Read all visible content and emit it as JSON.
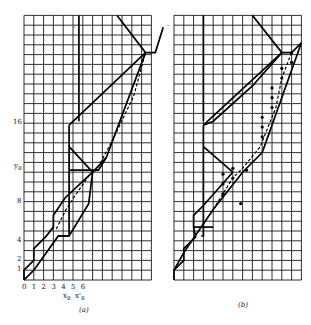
{
  "figure": {
    "cell_px": 9.8,
    "cols": 13,
    "rows": 27,
    "grid_color": "#1a1a1a",
    "line_color": "#000000"
  },
  "panels": [
    {
      "id": "a",
      "caption": "(a)",
      "origin_px": [
        24,
        280
      ],
      "x_ticks": [
        "0",
        "1",
        "2",
        "3",
        "4",
        "5",
        "6"
      ],
      "x_axis_label": "x_B  x'_B",
      "x_axis_label_parts": [
        "x",
        "B",
        "x'",
        "B"
      ],
      "y_ticks": [
        {
          "label": "1",
          "v": 1
        },
        {
          "label": "2",
          "v": 2
        },
        {
          "label": "4",
          "v": 4
        },
        {
          "label": "8",
          "v": 8
        },
        {
          "label": "16",
          "v": 16
        }
      ],
      "y_axis_label": "y_B",
      "y_axis_label_parts": [
        "y",
        "B"
      ],
      "y_axis_label_v": 11.6,
      "thick_lines": [
        [
          [
            5.6,
            27
          ],
          [
            5.6,
            16.2
          ]
        ],
        [
          [
            9.5,
            27
          ],
          [
            12.4,
            23.2
          ],
          [
            13.4,
            23.2
          ],
          [
            14.2,
            25.8
          ]
        ],
        [
          [
            4.6,
            15.8
          ],
          [
            4.6,
            4.5
          ],
          [
            3.5,
            4.5
          ]
        ],
        [
          [
            0,
            0
          ],
          [
            0,
            1
          ],
          [
            1,
            2
          ],
          [
            1,
            3.2
          ],
          [
            2.2,
            4.4
          ],
          [
            3,
            5.4
          ],
          [
            3,
            6.6
          ],
          [
            4.2,
            8.4
          ],
          [
            7,
            11
          ]
        ],
        [
          [
            4.6,
            15.8
          ],
          [
            12.4,
            23.2
          ]
        ],
        [
          [
            4.6,
            13.6
          ],
          [
            7,
            11
          ]
        ],
        [
          [
            0,
            0
          ],
          [
            1,
            1
          ],
          [
            3.5,
            4.5
          ],
          [
            4.6,
            4.5
          ],
          [
            6.6,
            7.8
          ],
          [
            7,
            11
          ],
          [
            8.4,
            12.5
          ],
          [
            12.4,
            23.2
          ]
        ],
        [
          [
            4.6,
            11.2
          ],
          [
            7.6,
            11.2
          ],
          [
            8.4,
            12.5
          ]
        ]
      ],
      "dashed_lines": [
        [
          [
            3.3,
            5.2
          ],
          [
            4.3,
            7.2
          ],
          [
            5.2,
            8.6
          ],
          [
            6.6,
            10.6
          ],
          [
            7.4,
            11.2
          ],
          [
            9.2,
            14.6
          ],
          [
            11.2,
            18.8
          ],
          [
            12.4,
            23.2
          ]
        ]
      ]
    },
    {
      "id": "b",
      "caption": "(b)",
      "origin_px": [
        174,
        280
      ],
      "x_ticks": [],
      "y_ticks": [],
      "thick_lines": [
        [
          [
            3,
            27
          ],
          [
            3,
            16.2
          ]
        ],
        [
          [
            8,
            27
          ],
          [
            11,
            23.2
          ],
          [
            12,
            23.2
          ],
          [
            13,
            24.2
          ]
        ],
        [
          [
            3,
            15.8
          ],
          [
            3,
            4.5
          ],
          [
            2.8,
            4.5
          ]
        ],
        [
          [
            0,
            0
          ],
          [
            0,
            1
          ],
          [
            1,
            2
          ],
          [
            1,
            3.2
          ],
          [
            2.2,
            4.4
          ],
          [
            2,
            5.4
          ],
          [
            2,
            6.6
          ],
          [
            3,
            7.6
          ],
          [
            6,
            11
          ]
        ],
        [
          [
            3,
            15.8
          ],
          [
            11,
            23.2
          ]
        ],
        [
          [
            3,
            13.6
          ],
          [
            6,
            11
          ]
        ],
        [
          [
            0,
            1
          ],
          [
            1,
            2.8
          ],
          [
            4,
            7.2
          ],
          [
            7,
            11
          ],
          [
            9,
            13
          ],
          [
            13,
            24.2
          ]
        ],
        [
          [
            3,
            15.8
          ],
          [
            4,
            16.2
          ],
          [
            8,
            19.8
          ],
          [
            11,
            23.2
          ]
        ],
        [
          [
            2,
            5.4
          ],
          [
            4,
            5.4
          ]
        ]
      ],
      "dashed_lines": [
        [
          [
            4,
            7.2
          ],
          [
            5,
            8.8
          ],
          [
            6,
            10.4
          ],
          [
            7,
            11.4
          ],
          [
            8.8,
            13.6
          ],
          [
            10.4,
            17.6
          ],
          [
            11,
            20.6
          ],
          [
            12,
            23.2
          ]
        ]
      ],
      "dots": [
        [
          5,
          8.8
        ],
        [
          5,
          9.8
        ],
        [
          5,
          10.8
        ],
        [
          6,
          10.4
        ],
        [
          6,
          11.4
        ],
        [
          9,
          14.6
        ],
        [
          9,
          15.6
        ],
        [
          9,
          16.6
        ],
        [
          10,
          17.6
        ],
        [
          10,
          18.6
        ],
        [
          10,
          19.6
        ],
        [
          11,
          20.6
        ],
        [
          11,
          21.6
        ],
        [
          12,
          22.2
        ],
        [
          12,
          23.2
        ],
        [
          7.4,
          11.2
        ],
        [
          6.8,
          7.8
        ]
      ]
    }
  ],
  "stray_marks": [
    {
      "panel": "a",
      "glyph": "·",
      "v": [
        5.0,
        26.0
      ]
    },
    {
      "panel": "a",
      "glyph": "·",
      "v": [
        14.6,
        26.2
      ]
    }
  ]
}
